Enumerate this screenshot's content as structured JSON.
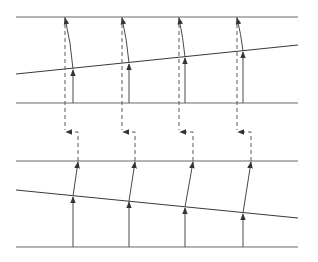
{
  "diagram": {
    "type": "ray-refraction-illustration",
    "width": 318,
    "height": 262,
    "colors": {
      "line": "#6a6a6a",
      "ray": "#4a4a4a",
      "background": "#ffffff"
    },
    "upper_panel": {
      "top_boundary": {
        "x1": 16,
        "y1": 17,
        "x2": 298,
        "y2": 17
      },
      "slanted_interface": {
        "x1": 16,
        "y1": 74,
        "x2": 298,
        "y2": 45
      },
      "bottom_boundary": {
        "x1": 16,
        "y1": 103,
        "x2": 298,
        "y2": 103
      },
      "rays": [
        {
          "base_x": 73,
          "hit_y": 69,
          "exit_x": 65
        },
        {
          "base_x": 129,
          "hit_y": 63,
          "exit_x": 122
        },
        {
          "base_x": 185,
          "hit_y": 57,
          "exit_x": 179
        },
        {
          "base_x": 243,
          "hit_y": 51,
          "exit_x": 237
        }
      ]
    },
    "lower_panel": {
      "top_boundary": {
        "x1": 16,
        "y1": 161,
        "x2": 298,
        "y2": 161
      },
      "slanted_interface": {
        "x1": 16,
        "y1": 190,
        "x2": 298,
        "y2": 218
      },
      "bottom_boundary": {
        "x1": 16,
        "y1": 247,
        "x2": 298,
        "y2": 247
      },
      "rays": [
        {
          "base_x": 73,
          "hit_y": 196,
          "exit_x": 78
        },
        {
          "base_x": 129,
          "hit_y": 201,
          "exit_x": 135
        },
        {
          "base_x": 185,
          "hit_y": 207,
          "exit_x": 193
        },
        {
          "base_x": 243,
          "hit_y": 213,
          "exit_x": 251
        }
      ]
    },
    "connectors": [
      {
        "upper_x": 65,
        "lower_x": 78,
        "turn_y": 132
      },
      {
        "upper_x": 122,
        "lower_x": 135,
        "turn_y": 132
      },
      {
        "upper_x": 179,
        "lower_x": 193,
        "turn_y": 132
      },
      {
        "upper_x": 237,
        "lower_x": 251,
        "turn_y": 132
      }
    ]
  }
}
